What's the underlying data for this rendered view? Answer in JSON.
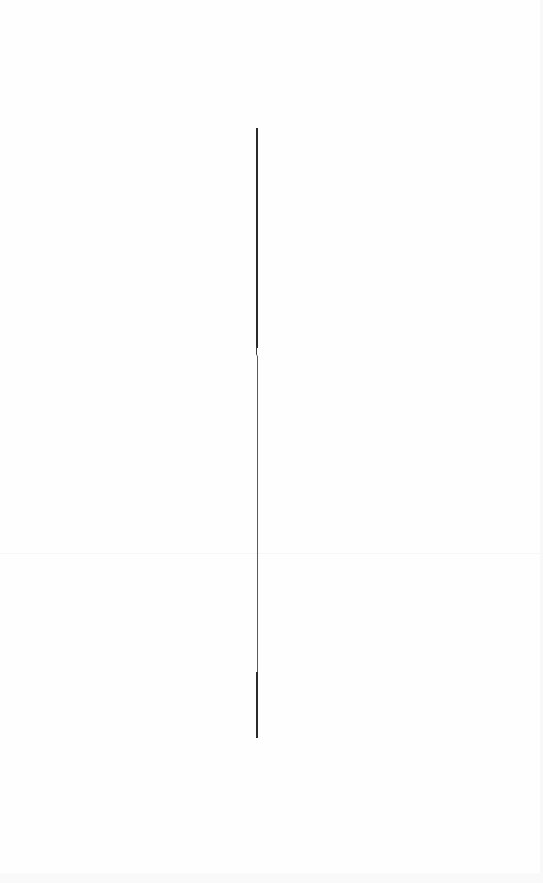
{
  "page": {
    "background": "#fefefe",
    "width": 543,
    "height": 883
  },
  "divider": {
    "color": "#2a2a2a",
    "x": 257,
    "top": 128,
    "bottom": 738
  },
  "seam": {
    "y": 553,
    "color": "#f6f6f6"
  }
}
